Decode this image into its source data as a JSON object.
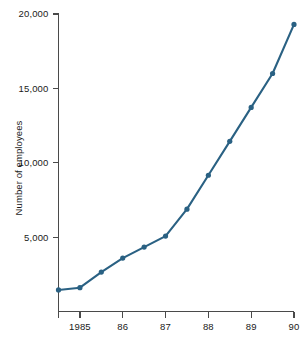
{
  "chart_data": {
    "type": "line",
    "title": "",
    "xlabel": "",
    "ylabel": "Number of employees",
    "xlim": [
      1984.5,
      1990.0
    ],
    "ylim": [
      0,
      20000
    ],
    "grid": false,
    "legend": false,
    "series_color": "#2a6183",
    "marker": "circle",
    "x_tick_positions": [
      1984.5,
      1985,
      1986,
      1987,
      1988,
      1989,
      1990
    ],
    "x_tick_labels": [
      "",
      "1985",
      "86",
      "87",
      "88",
      "89",
      "90"
    ],
    "y_tick_positions": [
      5000,
      10000,
      15000,
      20000
    ],
    "y_tick_labels": [
      "5,000",
      "10,000",
      "15,000",
      "20,000"
    ],
    "x": [
      1984.5,
      1985.0,
      1985.5,
      1986.0,
      1986.5,
      1987.0,
      1987.5,
      1988.0,
      1988.5,
      1989.0,
      1989.5,
      1990.0
    ],
    "values": [
      1450,
      1600,
      2650,
      3590,
      4330,
      5070,
      6880,
      9160,
      11440,
      13720,
      16000,
      19300
    ],
    "series": [
      {
        "name": "Number of employees",
        "values": [
          1450,
          1600,
          2650,
          3590,
          4330,
          5070,
          6880,
          9160,
          11440,
          13720,
          16000,
          19300
        ]
      }
    ]
  },
  "axis": {
    "y_title": "Number of employees"
  }
}
